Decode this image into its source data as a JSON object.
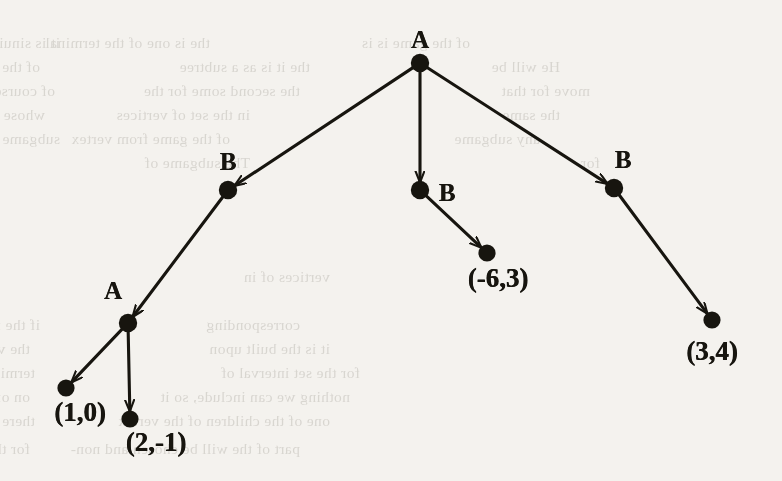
{
  "figure": {
    "type": "game-tree",
    "background_color": "#f4f2ee",
    "ink_color": "#17150f"
  },
  "nodes": [
    {
      "id": "root",
      "label": "A",
      "kind": "decision",
      "player": "A",
      "x": 420,
      "y": 63,
      "label_x": 420,
      "label_y": 40,
      "label_class": "player-label"
    },
    {
      "id": "b-left",
      "label": "B",
      "kind": "decision",
      "player": "B",
      "x": 228,
      "y": 190,
      "label_x": 228,
      "label_y": 162,
      "label_class": "player-label"
    },
    {
      "id": "b-mid",
      "label": "B",
      "kind": "decision",
      "player": "B",
      "x": 420,
      "y": 190,
      "label_x": 447,
      "label_y": 193,
      "label_class": "player-label"
    },
    {
      "id": "b-right",
      "label": "B",
      "kind": "decision",
      "player": "B",
      "x": 614,
      "y": 188,
      "label_x": 623,
      "label_y": 160,
      "label_class": "player-label"
    },
    {
      "id": "a-left",
      "label": "A",
      "kind": "decision",
      "player": "A",
      "x": 128,
      "y": 323,
      "label_x": 113,
      "label_y": 291,
      "label_class": "player-label"
    },
    {
      "id": "t-1-0",
      "label": "(1,0)",
      "kind": "terminal",
      "payoff": [
        1,
        0
      ],
      "x": 66,
      "y": 388,
      "label_x": 80,
      "label_y": 412,
      "label_class": "payoff-label"
    },
    {
      "id": "t-2-m1",
      "label": "(2,-1)",
      "kind": "terminal",
      "payoff": [
        2,
        -1
      ],
      "x": 130,
      "y": 419,
      "label_x": 156,
      "label_y": 442,
      "label_class": "payoff-label"
    },
    {
      "id": "t-m6-3",
      "label": "(-6,3)",
      "kind": "terminal",
      "payoff": [
        -6,
        3
      ],
      "x": 487,
      "y": 253,
      "label_x": 498,
      "label_y": 278,
      "label_class": "payoff-label"
    },
    {
      "id": "t-3-4",
      "label": "(3,4)",
      "kind": "terminal",
      "payoff": [
        3,
        4
      ],
      "x": 712,
      "y": 320,
      "label_x": 712,
      "label_y": 351,
      "label_class": "payoff-label"
    }
  ],
  "edges": [
    {
      "from": "root",
      "to": "b-left"
    },
    {
      "from": "root",
      "to": "b-mid"
    },
    {
      "from": "root",
      "to": "b-right"
    },
    {
      "from": "b-left",
      "to": "a-left"
    },
    {
      "from": "b-mid",
      "to": "t-m6-3"
    },
    {
      "from": "b-right",
      "to": "t-3-4"
    },
    {
      "from": "a-left",
      "to": "t-1-0"
    },
    {
      "from": "a-left",
      "to": "t-2-m1"
    }
  ],
  "ghost_text": [
    {
      "text": "it is sinuilar. Suppose",
      "x": 60,
      "y": 34
    },
    {
      "text": "the is one of the terminal",
      "x": 210,
      "y": 34
    },
    {
      "text": "of the game is is",
      "x": 470,
      "y": 34
    },
    {
      "text": "of the reachable, it is the",
      "x": 40,
      "y": 58
    },
    {
      "text": "the it is as a subtree",
      "x": 310,
      "y": 58
    },
    {
      "text": "He will be",
      "x": 560,
      "y": 58
    },
    {
      "text": "of course and vertex",
      "x": 55,
      "y": 82
    },
    {
      "text": "the second some for the",
      "x": 300,
      "y": 82
    },
    {
      "text": "move for that",
      "x": 590,
      "y": 82
    },
    {
      "text": "whose of the",
      "x": 45,
      "y": 106
    },
    {
      "text": "in the set of vertices",
      "x": 250,
      "y": 106
    },
    {
      "text": "the same",
      "x": 560,
      "y": 106
    },
    {
      "text": "subgame of",
      "x": 60,
      "y": 130
    },
    {
      "text": "of the game from vertex",
      "x": 230,
      "y": 130
    },
    {
      "text": "any subgame",
      "x": 540,
      "y": 130
    },
    {
      "text": "The subgame of",
      "x": 250,
      "y": 154
    },
    {
      "text": "for",
      "x": 600,
      "y": 154
    },
    {
      "text": "vertices of in",
      "x": 330,
      "y": 268
    },
    {
      "text": "if the following it is a",
      "x": 40,
      "y": 316
    },
    {
      "text": "corresponding",
      "x": 300,
      "y": 316
    },
    {
      "text": "the vertices of the game",
      "x": 30,
      "y": 340
    },
    {
      "text": "it is the built upon",
      "x": 330,
      "y": 340
    },
    {
      "text": "terminal vertex, set to label of",
      "x": 35,
      "y": 364
    },
    {
      "text": "for the set interval of",
      "x": 360,
      "y": 364
    },
    {
      "text": "on of application, the meaning of",
      "x": 30,
      "y": 388
    },
    {
      "text": "nothing we can include, so it",
      "x": 350,
      "y": 388
    },
    {
      "text": "there is a unique choice at",
      "x": 35,
      "y": 412
    },
    {
      "text": "one of the children of the vertex",
      "x": 330,
      "y": 412
    },
    {
      "text": "for these with a set the",
      "x": 30,
      "y": 440
    },
    {
      "text": "part of the will be chosen and non-",
      "x": 300,
      "y": 440
    }
  ]
}
